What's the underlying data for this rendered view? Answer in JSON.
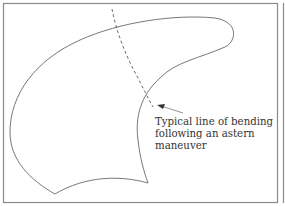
{
  "diagram": {
    "annotation": {
      "lines": [
        "Typical line of bending",
        "following an astern",
        "maneuver"
      ]
    },
    "colors": {
      "frame": "#8a8a8a",
      "outline": "#555555",
      "text": "#333333"
    }
  }
}
